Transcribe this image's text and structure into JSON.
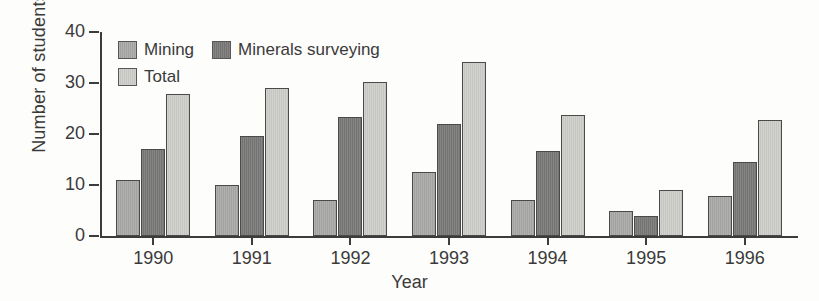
{
  "chart_data": {
    "type": "bar",
    "title": "",
    "xlabel": "Year",
    "ylabel": "Number of students",
    "categories": [
      "1990",
      "1991",
      "1992",
      "1993",
      "1994",
      "1995",
      "1996"
    ],
    "series": [
      {
        "name": "Mining",
        "color": "#a8a8a6",
        "values": [
          11,
          10,
          7,
          12.5,
          7,
          5,
          7.8
        ]
      },
      {
        "name": "Minerals surveying",
        "color": "#7c7c7a",
        "values": [
          17,
          19.6,
          23.4,
          21.9,
          16.6,
          4,
          14.6
        ]
      },
      {
        "name": "Total",
        "color": "#cbcbc7",
        "values": [
          27.8,
          29,
          30.2,
          34.2,
          23.8,
          9,
          22.8
        ]
      }
    ],
    "ylim": [
      0,
      40
    ],
    "yticks": [
      "0",
      "10",
      "20",
      "30",
      "40"
    ],
    "grid": false,
    "legend_position": "top-left",
    "legend_entries": [
      "Mining",
      "Minerals surveying",
      "Total"
    ]
  }
}
